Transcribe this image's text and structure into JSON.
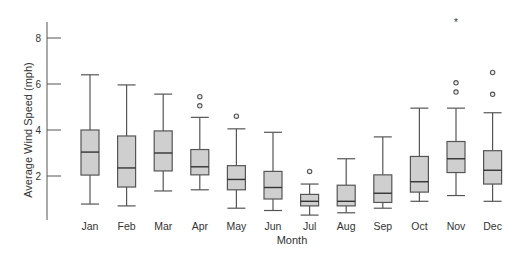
{
  "chart_data": {
    "type": "box",
    "title": "",
    "xlabel": "Month",
    "ylabel": "Average Wind Speed (mph)",
    "yticks": [
      2,
      4,
      6,
      8
    ],
    "ylim": [
      0,
      8.6
    ],
    "grid": false,
    "categories": [
      "Jan",
      "Feb",
      "Mar",
      "Apr",
      "May",
      "Jun",
      "Jul",
      "Aug",
      "Sep",
      "Oct",
      "Nov",
      "Dec"
    ],
    "boxes": [
      {
        "label": "Jan",
        "whisker_low": 0.78,
        "q1": 2.04,
        "median": 3.04,
        "q3": 4.0,
        "whisker_high": 6.4,
        "outliers": [],
        "extremes": []
      },
      {
        "label": "Feb",
        "whisker_low": 0.7,
        "q1": 1.52,
        "median": 2.35,
        "q3": 3.74,
        "whisker_high": 5.96,
        "outliers": [],
        "extremes": []
      },
      {
        "label": "Mar",
        "whisker_low": 1.35,
        "q1": 2.22,
        "median": 3.0,
        "q3": 3.96,
        "whisker_high": 5.56,
        "outliers": [],
        "extremes": []
      },
      {
        "label": "Apr",
        "whisker_low": 1.4,
        "q1": 2.05,
        "median": 2.4,
        "q3": 3.15,
        "whisker_high": 4.55,
        "outliers": [
          5.05,
          5.45
        ],
        "extremes": []
      },
      {
        "label": "May",
        "whisker_low": 0.6,
        "q1": 1.4,
        "median": 1.85,
        "q3": 2.45,
        "whisker_high": 4.05,
        "outliers": [
          4.6
        ],
        "extremes": []
      },
      {
        "label": "Jun",
        "whisker_low": 0.5,
        "q1": 1.0,
        "median": 1.5,
        "q3": 2.2,
        "whisker_high": 3.9,
        "outliers": [],
        "extremes": []
      },
      {
        "label": "Jul",
        "whisker_low": 0.3,
        "q1": 0.7,
        "median": 0.9,
        "q3": 1.2,
        "whisker_high": 1.65,
        "outliers": [
          2.2
        ],
        "extremes": []
      },
      {
        "label": "Aug",
        "whisker_low": 0.4,
        "q1": 0.7,
        "median": 0.9,
        "q3": 1.6,
        "whisker_high": 2.75,
        "outliers": [],
        "extremes": []
      },
      {
        "label": "Sep",
        "whisker_low": 0.6,
        "q1": 0.85,
        "median": 1.25,
        "q3": 2.05,
        "whisker_high": 3.7,
        "outliers": [],
        "extremes": []
      },
      {
        "label": "Oct",
        "whisker_low": 0.9,
        "q1": 1.3,
        "median": 1.75,
        "q3": 2.85,
        "whisker_high": 4.95,
        "outliers": [],
        "extremes": []
      },
      {
        "label": "Nov",
        "whisker_low": 1.15,
        "q1": 2.15,
        "median": 2.75,
        "q3": 3.5,
        "whisker_high": 4.95,
        "outliers": [
          5.65,
          6.05
        ],
        "extremes": [
          9.0
        ]
      },
      {
        "label": "Dec",
        "whisker_low": 0.9,
        "q1": 1.65,
        "median": 2.25,
        "q3": 3.1,
        "whisker_high": 4.75,
        "outliers": [
          5.55,
          6.5
        ],
        "extremes": []
      }
    ]
  },
  "colors": {
    "box_fill": "#cfcfcf",
    "stroke": "#555555",
    "text": "#333333"
  }
}
